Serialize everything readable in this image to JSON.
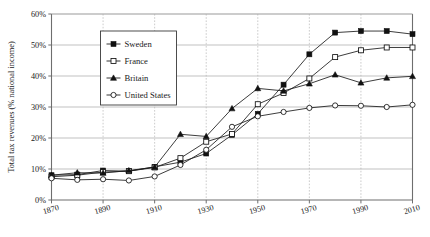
{
  "chart_data": {
    "type": "line",
    "title": "",
    "xlabel": "",
    "ylabel": "Total tax revenues (% national income)",
    "xlim": [
      1870,
      2010
    ],
    "ylim": [
      0,
      60
    ],
    "grid": true,
    "legend_position": "upper-left-inset",
    "x": [
      1870,
      1880,
      1890,
      1900,
      1910,
      1920,
      1930,
      1940,
      1950,
      1960,
      1970,
      1980,
      1990,
      2000,
      2010
    ],
    "xticks": [
      "1870",
      "1890",
      "1910",
      "1930",
      "1950",
      "1970",
      "1990",
      "2010"
    ],
    "xtick_values": [
      1870,
      1890,
      1910,
      1930,
      1950,
      1970,
      1990,
      2010
    ],
    "yticks": [
      "0%",
      "10%",
      "20%",
      "30%",
      "40%",
      "50%",
      "60%"
    ],
    "ytick_values": [
      0,
      10,
      20,
      30,
      40,
      50,
      60
    ],
    "series": [
      {
        "name": "Sweden",
        "marker": "filled-square",
        "values": [
          8.0,
          8.2,
          9.5,
          9.3,
          10.7,
          12.2,
          15.0,
          21.0,
          27.8,
          37.2,
          47.0,
          54.0,
          54.5,
          54.5,
          53.5
        ]
      },
      {
        "name": "France",
        "marker": "open-square",
        "values": [
          7.5,
          8.0,
          9.0,
          9.3,
          10.5,
          13.5,
          18.8,
          21.3,
          30.9,
          34.5,
          39.2,
          46.1,
          48.3,
          49.2,
          49.2
        ]
      },
      {
        "name": "Britain",
        "marker": "filled-triangle",
        "values": [
          8.0,
          8.8,
          8.7,
          9.5,
          10.6,
          21.2,
          20.5,
          29.5,
          36.0,
          35.2,
          37.5,
          40.4,
          37.8,
          39.4,
          39.9
        ]
      },
      {
        "name": "United States",
        "marker": "open-circle",
        "values": [
          7.0,
          6.5,
          6.7,
          6.3,
          7.6,
          11.3,
          16.2,
          23.6,
          27.0,
          28.4,
          29.7,
          30.5,
          30.4,
          30.0,
          30.7
        ]
      }
    ]
  },
  "legend": {
    "entries": [
      {
        "label": "Sweden",
        "marker": "filled-square"
      },
      {
        "label": "France",
        "marker": "open-square"
      },
      {
        "label": "Britain",
        "marker": "filled-triangle"
      },
      {
        "label": "United States",
        "marker": "open-circle"
      }
    ]
  }
}
